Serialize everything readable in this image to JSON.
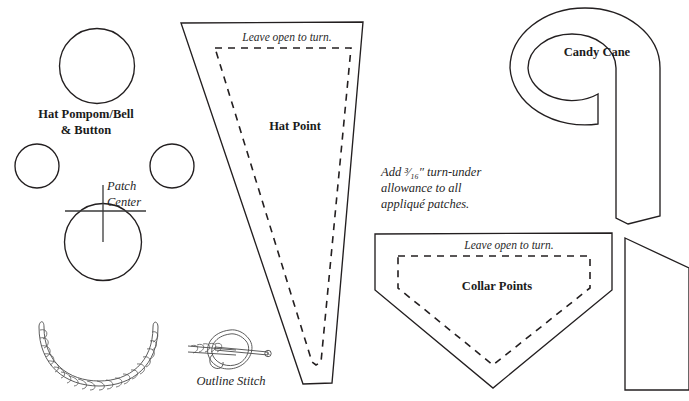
{
  "sheet": {
    "title": "Appliqué Pattern Template Sheet",
    "background_color": "#ffffff",
    "ink_color": "#231f20",
    "width": 689,
    "height": 401
  },
  "notes": {
    "allowance_note_line1": "Add ³⁄₁₆″ turn-under",
    "allowance_note_line2": "allowance to all",
    "allowance_note_line3": "appliqué patches."
  },
  "pieces": [
    {
      "id": "hat-pompom-bell-button",
      "label_line1": "Hat Pompom/Bell",
      "label_line2": "& Button",
      "shape": "circle",
      "count": 3
    },
    {
      "id": "patch-center",
      "label_line1": "Patch",
      "label_line2": "Center",
      "shape": "circle-with-crosshair"
    },
    {
      "id": "hat-point",
      "label": "Hat Point",
      "seam_note": "Leave open to turn.",
      "shape": "tapered-triangle"
    },
    {
      "id": "candy-cane",
      "label": "Candy Cane",
      "shape": "hook"
    },
    {
      "id": "collar-points",
      "label": "Collar Points",
      "seam_note": "Leave open to turn.",
      "shape": "shield-pentagon"
    },
    {
      "id": "partial-piece-right",
      "label": "",
      "shape": "quadrilateral"
    }
  ],
  "stitch_diagrams": [
    {
      "id": "twisted-cord",
      "label": ""
    },
    {
      "id": "outline-stitch",
      "label": "Outline Stitch"
    }
  ]
}
